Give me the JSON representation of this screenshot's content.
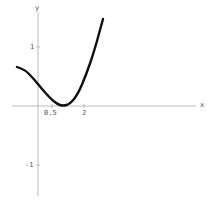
{
  "chart_data": {
    "type": "line",
    "title": "",
    "xlabel": "x",
    "ylabel": "y",
    "x_ticks": [
      "0.5",
      "2"
    ],
    "y_ticks": [
      "1",
      "-1"
    ],
    "xlim": [
      -0.7,
      5.5
    ],
    "ylim": [
      -1.5,
      1.6
    ],
    "grid": false,
    "legend": null,
    "series": [
      {
        "name": "curve",
        "color": "#111111",
        "points_px": [
          [
            17,
            67
          ],
          [
            25,
            70
          ],
          [
            33,
            78
          ],
          [
            42,
            89
          ],
          [
            50,
            98
          ],
          [
            57,
            104
          ],
          [
            63,
            106
          ],
          [
            70,
            104
          ],
          [
            78,
            94
          ],
          [
            86,
            75
          ],
          [
            94,
            52
          ],
          [
            103,
            19
          ]
        ]
      }
    ]
  },
  "axes": {
    "x_label": "x",
    "y_label": "y",
    "x_tick_1": "0.5",
    "x_tick_2": "2",
    "y_tick_pos": "1",
    "y_tick_neg": "-1"
  }
}
